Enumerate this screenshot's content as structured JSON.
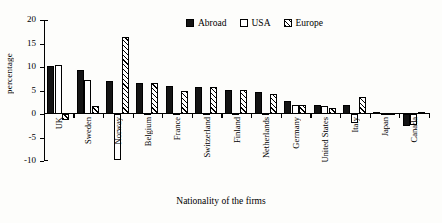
{
  "chart_data": {
    "type": "bar",
    "title": "",
    "subtitle": "",
    "xlabel": "Nationality of the firms",
    "ylabel": "percentage",
    "ylim": [
      -10,
      20
    ],
    "yticks": [
      20,
      15,
      10,
      5,
      0,
      -5,
      -10
    ],
    "grid": false,
    "legend_position": "top-right",
    "categories": [
      "UK",
      "Sweden",
      "Norway",
      "Belgium",
      "France",
      "Switzerland",
      "Finland",
      "Netherlands",
      "Germany",
      "United States",
      "Italy",
      "Japan",
      "Canada"
    ],
    "series": [
      {
        "name": "Abroad",
        "fill": "solid-black",
        "values": [
          10.2,
          9.3,
          7.1,
          6.7,
          5.9,
          5.7,
          5.1,
          4.6,
          2.8,
          1.9,
          1.9,
          0.5,
          -2.6
        ]
      },
      {
        "name": "USA",
        "fill": "white",
        "values": [
          10.4,
          7.2,
          -9.8,
          0.2,
          0.3,
          0.2,
          0.2,
          0.2,
          1.9,
          1.7,
          -1.9,
          0.2,
          -2.3
        ]
      },
      {
        "name": "Europe",
        "fill": "hatched",
        "values": [
          -1.3,
          1.8,
          16.3,
          6.7,
          4.8,
          5.7,
          5.2,
          4.2,
          1.9,
          1.2,
          3.6,
          0.2,
          0.5
        ]
      }
    ]
  },
  "legend": {
    "items": [
      {
        "label": "Abroad",
        "swatch": "solid-black-swatch"
      },
      {
        "label": "USA",
        "swatch": "white-swatch"
      },
      {
        "label": "Europe",
        "swatch": "hatched-swatch"
      }
    ]
  },
  "axes": {
    "y_title": "percentage",
    "x_title": "Nationality of the firms",
    "y_tick_labels": [
      "20",
      "15",
      "10",
      "5",
      "0",
      "-5",
      "-10"
    ]
  },
  "colors": {
    "ink": "#000000",
    "background": "#fdfdfb",
    "abroad_fill": "#141414",
    "usa_fill": "#ffffff"
  }
}
